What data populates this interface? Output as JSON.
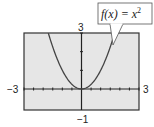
{
  "chart_data": {
    "type": "line",
    "title": "",
    "annotation": "f(x) = x²",
    "annotation_parts": {
      "lhs": "f(x) = x",
      "exp": "2"
    },
    "xlabel": "",
    "ylabel": "",
    "xlim": [
      -3,
      3
    ],
    "ylim": [
      -1,
      3
    ],
    "x_tick_step": 0.5,
    "y_tick_step": 1,
    "tick_labels": {
      "xmin": "−3",
      "xmax": "3",
      "ymin": "−1",
      "ymax": "3"
    },
    "grid": false,
    "series": [
      {
        "name": "f(x) = x^2",
        "x": [
          -1.73,
          -1.5,
          -1.25,
          -1.0,
          -0.75,
          -0.5,
          -0.25,
          0,
          0.25,
          0.5,
          0.75,
          1.0,
          1.25,
          1.5,
          1.73
        ],
        "values": [
          3.0,
          2.25,
          1.5625,
          1.0,
          0.5625,
          0.25,
          0.0625,
          0,
          0.0625,
          0.25,
          0.5625,
          1.0,
          1.5625,
          2.25,
          3.0
        ]
      }
    ]
  },
  "colors": {
    "plot_bg": "#e6e6e6",
    "frame": "#333333",
    "curve": "#444444"
  }
}
